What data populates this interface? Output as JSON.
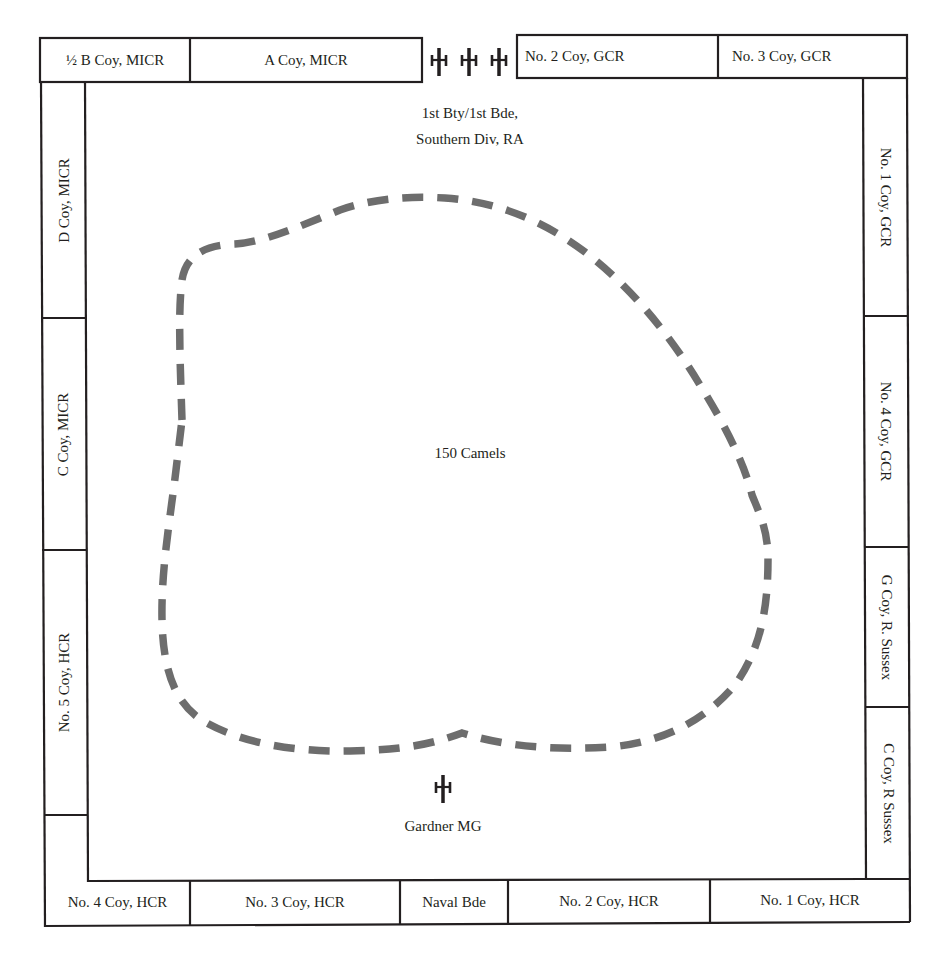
{
  "diagram": {
    "type": "square formation",
    "top_row": [
      {
        "label": "½ B Coy, MICR"
      },
      {
        "label": "A Coy, MICR"
      },
      {
        "label": "No. 2 Coy, GCR"
      },
      {
        "label": "No. 3 Coy, GCR"
      }
    ],
    "top_guns": {
      "count": 3,
      "icon": "field-gun-icon"
    },
    "left_column": [
      {
        "label": "D Coy, MICR"
      },
      {
        "label": "C Coy, MICR"
      },
      {
        "label": "No. 5 Coy, HCR"
      }
    ],
    "right_column": [
      {
        "label": "No. 1 Coy, GCR"
      },
      {
        "label": "No. 4 Coy, GCR"
      },
      {
        "label": "G Coy, R. Sussex"
      },
      {
        "label": "C Coy, R Sussex"
      }
    ],
    "bottom_row": [
      {
        "label": "No. 4 Coy, HCR"
      },
      {
        "label": "No. 3 Coy, HCR"
      },
      {
        "label": "Naval Bde"
      },
      {
        "label": "No. 2 Coy, HCR"
      },
      {
        "label": "No. 1 Coy, HCR"
      }
    ],
    "interior": {
      "battery_line1": "1st Bty/1st Bde,",
      "battery_line2": "Southern Div, RA",
      "camels": "150 Camels",
      "machine_gun": "Gardner MG"
    },
    "colors": {
      "line": "#231f20",
      "dashed_boundary": "#6d6d6d",
      "background": "#ffffff"
    }
  }
}
